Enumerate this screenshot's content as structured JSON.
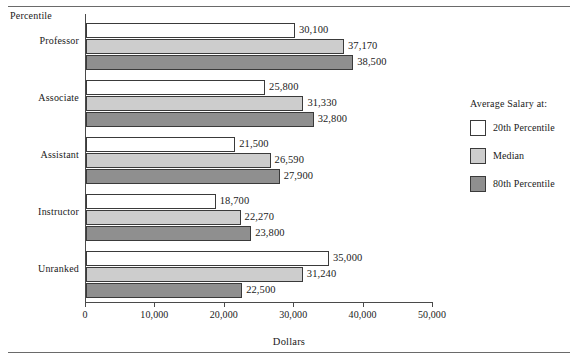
{
  "figure": {
    "y_axis_title": "Percentile",
    "x_axis_title": "Dollars"
  },
  "legend": {
    "title": "Average Salary at:",
    "entries": [
      {
        "label": "20th Percentile",
        "color": "#ffffff"
      },
      {
        "label": "Median",
        "color": "#cdcdcd"
      },
      {
        "label": "80th Percentile",
        "color": "#8f8f8f"
      }
    ]
  },
  "chart_data": {
    "type": "bar",
    "orientation": "horizontal",
    "title": "",
    "xlabel": "Dollars",
    "ylabel": "Percentile",
    "xlim": [
      0,
      50000
    ],
    "grid": false,
    "legend_position": "right",
    "xticks": [
      0,
      10000,
      20000,
      30000,
      40000,
      50000
    ],
    "xtick_labels": [
      "0",
      "10,000",
      "20,000",
      "30,000",
      "40,000",
      "50,000"
    ],
    "categories": [
      "Professor",
      "Associate",
      "Assistant",
      "Instructor",
      "Unranked"
    ],
    "series": [
      {
        "name": "20th Percentile",
        "color": "#ffffff",
        "values": [
          30100,
          25800,
          21500,
          18700,
          35000
        ],
        "labels": [
          "30,100",
          "25,800",
          "21,500",
          "18,700",
          "35,000"
        ]
      },
      {
        "name": "Median",
        "color": "#cdcdcd",
        "values": [
          37170,
          31330,
          26590,
          22270,
          31240
        ],
        "labels": [
          "37,170",
          "31,330",
          "26,590",
          "22,270",
          "31,240"
        ]
      },
      {
        "name": "80th Percentile",
        "color": "#8f8f8f",
        "values": [
          38500,
          32800,
          27900,
          23800,
          22500
        ],
        "labels": [
          "38,500",
          "32,800",
          "27,900",
          "23,800",
          "22,500"
        ]
      }
    ]
  }
}
